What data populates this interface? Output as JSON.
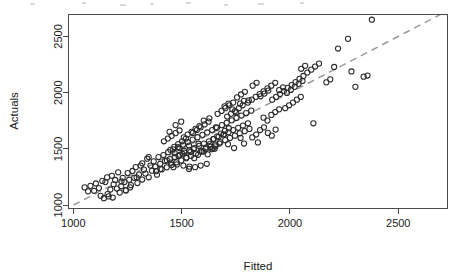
{
  "figure": {
    "background_color": "#ffffff",
    "width": 462,
    "height": 279
  },
  "chart_data": {
    "type": "scatter",
    "title": "",
    "xlabel": "Fitted",
    "ylabel": "Actuals",
    "xlim": [
      980,
      2725
    ],
    "ylim": [
      975,
      2690
    ],
    "xticks": [
      1000,
      1500,
      2000,
      2500
    ],
    "yticks": [
      1000,
      1500,
      2000,
      2500
    ],
    "xtick_labels": [
      "1000",
      "1500",
      "2000",
      "2500"
    ],
    "ytick_labels": [
      "1000",
      "1500",
      "2000",
      "2500"
    ],
    "grid": false,
    "legend": null,
    "marker": {
      "shape": "open-circle",
      "radius_px": 2.6,
      "stroke_color": "#2b2b2b",
      "fill": "none"
    },
    "reference_line": {
      "name": "identity-line",
      "style": "dashed",
      "color": "#9a9a9a",
      "from": [
        1000,
        1000
      ],
      "to": [
        2725,
        2725
      ],
      "description": "y = x diagonal reference line"
    },
    "series": [
      {
        "name": "Fitted vs Actuals",
        "n_points": 252,
        "points": [
          [
            1052,
            1158
          ],
          [
            1068,
            1123
          ],
          [
            1079,
            1172
          ],
          [
            1096,
            1128
          ],
          [
            1104,
            1193
          ],
          [
            1118,
            1152
          ],
          [
            1126,
            1083
          ],
          [
            1134,
            1216
          ],
          [
            1141,
            1062
          ],
          [
            1148,
            1205
          ],
          [
            1156,
            1247
          ],
          [
            1163,
            1078
          ],
          [
            1171,
            1139
          ],
          [
            1178,
            1261
          ],
          [
            1186,
            1186
          ],
          [
            1193,
            1224
          ],
          [
            1201,
            1148
          ],
          [
            1207,
            1292
          ],
          [
            1214,
            1112
          ],
          [
            1221,
            1168
          ],
          [
            1228,
            1243
          ],
          [
            1236,
            1206
          ],
          [
            1243,
            1131
          ],
          [
            1251,
            1286
          ],
          [
            1258,
            1225
          ],
          [
            1266,
            1178
          ],
          [
            1273,
            1304
          ],
          [
            1281,
            1243
          ],
          [
            1288,
            1338
          ],
          [
            1296,
            1197
          ],
          [
            1303,
            1271
          ],
          [
            1311,
            1352
          ],
          [
            1318,
            1228
          ],
          [
            1326,
            1316
          ],
          [
            1333,
            1281
          ],
          [
            1341,
            1413
          ],
          [
            1348,
            1248
          ],
          [
            1356,
            1352
          ],
          [
            1363,
            1306
          ],
          [
            1371,
            1389
          ],
          [
            1378,
            1343
          ],
          [
            1386,
            1271
          ],
          [
            1393,
            1428
          ],
          [
            1401,
            1368
          ],
          [
            1408,
            1318
          ],
          [
            1416,
            1446
          ],
          [
            1423,
            1392
          ],
          [
            1431,
            1336
          ],
          [
            1438,
            1471
          ],
          [
            1446,
            1409
          ],
          [
            1453,
            1358
          ],
          [
            1461,
            1497
          ],
          [
            1468,
            1428
          ],
          [
            1476,
            1381
          ],
          [
            1483,
            1516
          ],
          [
            1491,
            1448
          ],
          [
            1498,
            1398
          ],
          [
            1506,
            1538
          ],
          [
            1513,
            1468
          ],
          [
            1521,
            1418
          ],
          [
            1528,
            1561
          ],
          [
            1536,
            1488
          ],
          [
            1543,
            1438
          ],
          [
            1551,
            1582
          ],
          [
            1558,
            1508
          ],
          [
            1566,
            1458
          ],
          [
            1573,
            1604
          ],
          [
            1581,
            1528
          ],
          [
            1588,
            1478
          ],
          [
            1596,
            1625
          ],
          [
            1603,
            1548
          ],
          [
            1611,
            1498
          ],
          [
            1618,
            1646
          ],
          [
            1626,
            1568
          ],
          [
            1633,
            1518
          ],
          [
            1641,
            1668
          ],
          [
            1648,
            1588
          ],
          [
            1656,
            1538
          ],
          [
            1663,
            1689
          ],
          [
            1671,
            1608
          ],
          [
            1678,
            1558
          ],
          [
            1686,
            1711
          ],
          [
            1693,
            1628
          ],
          [
            1701,
            1578
          ],
          [
            1708,
            1732
          ],
          [
            1716,
            1648
          ],
          [
            1723,
            1598
          ],
          [
            1731,
            1754
          ],
          [
            1738,
            1668
          ],
          [
            1746,
            1618
          ],
          [
            1753,
            1775
          ],
          [
            1761,
            1688
          ],
          [
            1768,
            1638
          ],
          [
            1776,
            1797
          ],
          [
            1783,
            1708
          ],
          [
            1791,
            1658
          ],
          [
            1798,
            1818
          ],
          [
            1806,
            1728
          ],
          [
            1813,
            1678
          ],
          [
            1821,
            1840
          ],
          [
            1490,
            1508
          ],
          [
            1512,
            1482
          ],
          [
            1534,
            1530
          ],
          [
            1556,
            1498
          ],
          [
            1578,
            1546
          ],
          [
            1468,
            1462
          ],
          [
            1486,
            1438
          ],
          [
            1504,
            1456
          ],
          [
            1522,
            1424
          ],
          [
            1540,
            1472
          ],
          [
            1448,
            1492
          ],
          [
            1466,
            1518
          ],
          [
            1484,
            1542
          ],
          [
            1502,
            1568
          ],
          [
            1520,
            1592
          ],
          [
            1558,
            1418
          ],
          [
            1576,
            1448
          ],
          [
            1594,
            1478
          ],
          [
            1612,
            1512
          ],
          [
            1630,
            1542
          ],
          [
            1432,
            1398
          ],
          [
            1450,
            1378
          ],
          [
            1478,
            1362
          ],
          [
            1508,
            1352
          ],
          [
            1536,
            1342
          ],
          [
            1552,
            1642
          ],
          [
            1570,
            1668
          ],
          [
            1588,
            1692
          ],
          [
            1606,
            1718
          ],
          [
            1624,
            1742
          ],
          [
            1418,
            1568
          ],
          [
            1436,
            1592
          ],
          [
            1454,
            1616
          ],
          [
            1472,
            1640
          ],
          [
            1490,
            1664
          ],
          [
            1646,
            1588
          ],
          [
            1664,
            1612
          ],
          [
            1682,
            1636
          ],
          [
            1700,
            1660
          ],
          [
            1718,
            1684
          ],
          [
            1602,
            1478
          ],
          [
            1620,
            1452
          ],
          [
            1638,
            1498
          ],
          [
            1656,
            1522
          ],
          [
            1674,
            1548
          ],
          [
            1710,
            1788
          ],
          [
            1728,
            1812
          ],
          [
            1746,
            1836
          ],
          [
            1764,
            1862
          ],
          [
            1782,
            1888
          ],
          [
            1806,
            1912
          ],
          [
            1824,
            1938
          ],
          [
            1842,
            1962
          ],
          [
            1860,
            1988
          ],
          [
            1878,
            2012
          ],
          [
            1896,
            2038
          ],
          [
            1914,
            2062
          ],
          [
            1932,
            2088
          ],
          [
            1950,
            2022
          ],
          [
            1968,
            2048
          ],
          [
            1986,
            1998
          ],
          [
            2004,
            2024
          ],
          [
            2022,
            2052
          ],
          [
            2040,
            2078
          ],
          [
            2058,
            2104
          ],
          [
            1828,
            2062
          ],
          [
            1846,
            2088
          ],
          [
            1864,
            1968
          ],
          [
            1882,
            1992
          ],
          [
            1900,
            2018
          ],
          [
            1918,
            1938
          ],
          [
            1936,
            1962
          ],
          [
            1954,
            1988
          ],
          [
            1972,
            2014
          ],
          [
            1990,
            2042
          ],
          [
            2008,
            2068
          ],
          [
            2026,
            2094
          ],
          [
            2044,
            2122
          ],
          [
            2062,
            2148
          ],
          [
            2080,
            2178
          ],
          [
            2098,
            2204
          ],
          [
            2116,
            2232
          ],
          [
            2134,
            2258
          ],
          [
            2052,
            2212
          ],
          [
            2070,
            2238
          ],
          [
            1756,
            1958
          ],
          [
            1774,
            1984
          ],
          [
            1792,
            2008
          ],
          [
            1810,
            1932
          ],
          [
            1698,
            1878
          ],
          [
            1716,
            1902
          ],
          [
            1734,
            1852
          ],
          [
            1752,
            1826
          ],
          [
            1770,
            1902
          ],
          [
            1788,
            1928
          ],
          [
            1666,
            1812
          ],
          [
            1684,
            1838
          ],
          [
            1702,
            1862
          ],
          [
            1720,
            1888
          ],
          [
            1738,
            1912
          ],
          [
            1878,
            1778
          ],
          [
            1896,
            1752
          ],
          [
            1914,
            1802
          ],
          [
            1932,
            1828
          ],
          [
            1950,
            1852
          ],
          [
            1862,
            1668
          ],
          [
            1880,
            1692
          ],
          [
            1898,
            1642
          ],
          [
            1916,
            1618
          ],
          [
            1934,
            1672
          ],
          [
            1978,
            1862
          ],
          [
            1996,
            1888
          ],
          [
            2014,
            1912
          ],
          [
            2032,
            1938
          ],
          [
            2050,
            1962
          ],
          [
            2108,
            1728
          ],
          [
            2168,
            2092
          ],
          [
            2186,
            2118
          ],
          [
            2204,
            2228
          ],
          [
            2222,
            2392
          ],
          [
            2268,
            2478
          ],
          [
            2284,
            2188
          ],
          [
            2302,
            2052
          ],
          [
            2340,
            2142
          ],
          [
            2358,
            2152
          ],
          [
            2378,
            2648
          ],
          [
            1852,
            1558
          ],
          [
            1788,
            1548
          ],
          [
            1742,
            1508
          ],
          [
            1652,
            1502
          ],
          [
            1292,
            1248
          ],
          [
            1318,
            1372
          ],
          [
            1348,
            1428
          ],
          [
            1382,
            1302
          ],
          [
            1402,
            1322
          ],
          [
            1222,
            1212
          ],
          [
            1242,
            1132
          ],
          [
            1262,
            1158
          ],
          [
            1158,
            1098
          ],
          [
            1182,
            1068
          ],
          [
            1534,
            1322
          ],
          [
            1562,
            1338
          ],
          [
            1588,
            1352
          ],
          [
            1616,
            1368
          ],
          [
            1644,
            1502
          ],
          [
            1510,
            1602
          ],
          [
            1528,
            1628
          ],
          [
            1546,
            1652
          ],
          [
            1564,
            1678
          ],
          [
            1582,
            1702
          ],
          [
            1472,
            1712
          ],
          [
            1498,
            1742
          ],
          [
            1602,
            1752
          ],
          [
            1628,
            1772
          ],
          [
            1658,
            1692
          ],
          [
            1444,
            1652
          ],
          [
            1462,
            1338
          ],
          [
            1696,
            1628
          ],
          [
            1714,
            1542
          ],
          [
            1772,
            1598
          ],
          [
            1826,
            1602
          ],
          [
            1844,
            1628
          ]
        ]
      }
    ]
  },
  "axis": {
    "ylabel_text": "Actuals",
    "xlabel_text": "Fitted"
  }
}
